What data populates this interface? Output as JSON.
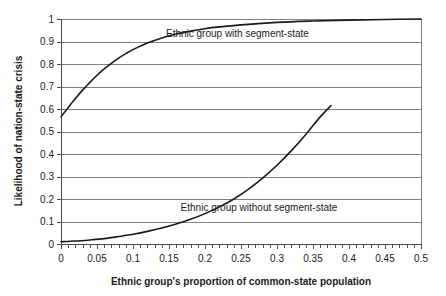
{
  "chart_data": {
    "type": "line",
    "title": "",
    "xlabel": "Ethnic group's proportion of common-state population",
    "ylabel": "Likelihood of nation-state crisis",
    "xlim": [
      0,
      0.5
    ],
    "ylim": [
      0,
      1
    ],
    "grid": true,
    "grid_axis": "y",
    "legend_position": "inline-annotation",
    "xticks": [
      0,
      0.05,
      0.1,
      0.15,
      0.2,
      0.25,
      0.3,
      0.35,
      0.4,
      0.45,
      0.5
    ],
    "xtick_labels": [
      "0",
      "0.05",
      "0.1",
      "0.15",
      "0.2",
      "0.25",
      "0.3",
      "0.35",
      "0.4",
      "0.45",
      "0.5"
    ],
    "xminor_step": 0.01,
    "yticks": [
      0,
      0.1,
      0.2,
      0.3,
      0.4,
      0.5,
      0.6,
      0.7,
      0.8,
      0.9,
      1
    ],
    "ytick_labels": [
      "0",
      "0.1",
      "0.2",
      "0.3",
      "0.4",
      "0.5",
      "0.6",
      "0.7",
      "0.8",
      "0.9",
      "1"
    ],
    "series": [
      {
        "name": "Ethnic group with segment-state",
        "label_x": 0.245,
        "label_y": 0.935,
        "color": "#1a1a1a",
        "x": [
          0.0,
          0.01,
          0.02,
          0.03,
          0.04,
          0.05,
          0.06,
          0.07,
          0.08,
          0.09,
          0.1,
          0.12,
          0.14,
          0.16,
          0.18,
          0.2,
          0.22,
          0.25,
          0.3,
          0.35,
          0.4,
          0.45,
          0.5
        ],
        "values": [
          0.565,
          0.607,
          0.647,
          0.684,
          0.718,
          0.75,
          0.778,
          0.803,
          0.826,
          0.846,
          0.864,
          0.893,
          0.916,
          0.933,
          0.946,
          0.957,
          0.965,
          0.974,
          0.985,
          0.991,
          0.995,
          0.998,
          1.0
        ]
      },
      {
        "name": "Ethnic group without segment-state",
        "label_x": 0.275,
        "label_y": 0.163,
        "color": "#1a1a1a",
        "x": [
          0.0,
          0.02,
          0.04,
          0.06,
          0.08,
          0.1,
          0.12,
          0.14,
          0.16,
          0.18,
          0.2,
          0.22,
          0.24,
          0.26,
          0.28,
          0.3,
          0.32,
          0.34,
          0.36,
          0.375
        ],
        "values": [
          0.01,
          0.013,
          0.018,
          0.024,
          0.033,
          0.043,
          0.056,
          0.071,
          0.089,
          0.11,
          0.135,
          0.165,
          0.2,
          0.243,
          0.293,
          0.35,
          0.415,
          0.487,
          0.565,
          0.615
        ]
      }
    ]
  },
  "axes": {
    "y_title": "Likelihood of nation-state crisis",
    "x_title": "Ethnic group's proportion of common-state population"
  }
}
